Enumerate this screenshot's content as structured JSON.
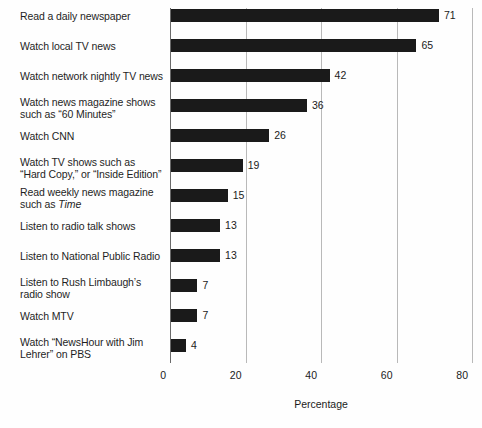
{
  "chart_data": {
    "type": "bar",
    "orientation": "horizontal",
    "title": "",
    "xlabel": "Percentage",
    "ylabel": "",
    "xlim": [
      0,
      80
    ],
    "xticks": [
      0,
      20,
      40,
      60,
      80
    ],
    "grid": true,
    "legend": false,
    "bar_color": "#1a1a1a",
    "categories": [
      "Read a daily newspaper",
      "Watch local TV news",
      "Watch network nightly TV news",
      "Watch news magazine shows such as “60 Minutes”",
      "Watch CNN",
      "Watch TV shows such as “Hard Copy,” or “Inside Edition”",
      "Read weekly news magazine such as Time",
      "Listen to radio talk shows",
      "Listen to National Public Radio",
      "Listen to Rush Limbaugh’s radio show",
      "Watch MTV",
      "Watch “NewsHour with Jim Lehrer” on PBS"
    ],
    "values": [
      71,
      65,
      42,
      36,
      26,
      19,
      15,
      13,
      13,
      7,
      7,
      4
    ]
  },
  "rows": [
    {
      "label_line1": "Read a daily newspaper",
      "label_line2": "",
      "value": 71,
      "value_text": "71"
    },
    {
      "label_line1": "Watch local TV news",
      "label_line2": "",
      "value": 65,
      "value_text": "65"
    },
    {
      "label_line1": "Watch network nightly TV news",
      "label_line2": "",
      "value": 42,
      "value_text": "42"
    },
    {
      "label_line1": "Watch news magazine shows",
      "label_line2": "such as “60 Minutes”",
      "value": 36,
      "value_text": "36"
    },
    {
      "label_line1": "Watch CNN",
      "label_line2": "",
      "value": 26,
      "value_text": "26"
    },
    {
      "label_line1": "Watch TV shows such as",
      "label_line2": "“Hard Copy,” or “Inside Edition”",
      "value": 19,
      "value_text": "19"
    },
    {
      "label_line1": "Read weekly news magazine",
      "label_line2": "such as ",
      "label_line2_italic": "Time",
      "value": 15,
      "value_text": "15"
    },
    {
      "label_line1": "Listen to radio talk shows",
      "label_line2": "",
      "value": 13,
      "value_text": "13"
    },
    {
      "label_line1": "Listen to National Public Radio",
      "label_line2": "",
      "value": 13,
      "value_text": "13"
    },
    {
      "label_line1": "Listen to Rush Limbaugh’s",
      "label_line2": "radio show",
      "value": 7,
      "value_text": "7"
    },
    {
      "label_line1": "Watch MTV",
      "label_line2": "",
      "value": 7,
      "value_text": "7"
    },
    {
      "label_line1": "Watch “NewsHour with Jim",
      "label_line2": "Lehrer” on PBS",
      "value": 4,
      "value_text": "4"
    }
  ],
  "x_axis": {
    "ticks": [
      {
        "label": "0",
        "value": 0
      },
      {
        "label": "20",
        "value": 20
      },
      {
        "label": "40",
        "value": 40
      },
      {
        "label": "60",
        "value": 60
      },
      {
        "label": "80",
        "value": 80
      }
    ],
    "title": "Percentage"
  }
}
